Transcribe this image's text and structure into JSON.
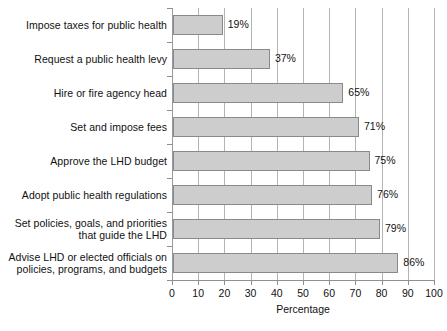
{
  "chart_data": {
    "type": "bar",
    "orientation": "horizontal",
    "title": "",
    "xlabel": "Percentage",
    "ylabel": "",
    "xlim": [
      0,
      100
    ],
    "xticks": [
      0,
      10,
      20,
      30,
      40,
      50,
      60,
      70,
      80,
      90,
      100
    ],
    "grid": true,
    "legend": false,
    "value_suffix": "%",
    "categories": [
      "Impose taxes for public health",
      "Request a public health levy",
      "Hire or fire agency head",
      "Set and impose fees",
      "Approve the LHD budget",
      "Adopt public health regulations",
      "Set policies, goals, and priorities that guide the LHD",
      "Advise LHD or elected officials on policies, programs, and budgets"
    ],
    "category_lines": [
      [
        "Impose taxes for public health"
      ],
      [
        "Request a public health levy"
      ],
      [
        "Hire or fire agency head"
      ],
      [
        "Set and impose fees"
      ],
      [
        "Approve the LHD budget"
      ],
      [
        "Adopt public health regulations"
      ],
      [
        "Set policies, goals, and priorities",
        "that guide the LHD"
      ],
      [
        "Advise LHD or elected officials on",
        "policies, programs, and budgets"
      ]
    ],
    "values": [
      19,
      37,
      65,
      71,
      75,
      76,
      79,
      86
    ],
    "data_labels": [
      "19%",
      "37%",
      "65%",
      "71%",
      "75%",
      "76%",
      "79%",
      "86%"
    ],
    "colors": {
      "bar_fill": "#cdcdcd",
      "bar_border": "#8a8a8a",
      "gridline": "#b4b4b4",
      "axis": "#8f8f8f",
      "text": "#111111",
      "background": "#ffffff"
    }
  }
}
